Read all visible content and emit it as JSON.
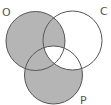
{
  "diagram": {
    "type": "venn",
    "sets": [
      {
        "label": "O",
        "cx": 35.5,
        "cy": 41,
        "r": 29.5
      },
      {
        "label": "C",
        "cx": 72.5,
        "cy": 40.5,
        "r": 29.5
      },
      {
        "label": "P",
        "cx": 53.5,
        "cy": 75,
        "r": 29
      }
    ],
    "shaded_regions": [
      "O only",
      "O∩C not P",
      "O∩P not C",
      "P only"
    ],
    "unshaded_regions": [
      "C only",
      "C∩P not O",
      "O∩C∩P"
    ],
    "colors": {
      "shade": "#b5b5b5",
      "stroke": "#555555",
      "background": "#ffffff"
    }
  }
}
